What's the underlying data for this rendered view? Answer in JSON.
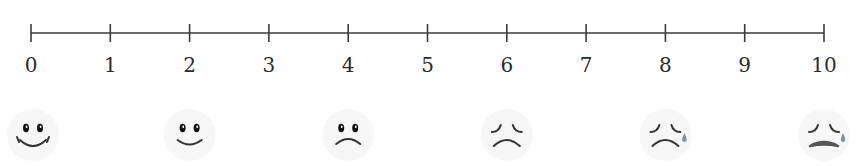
{
  "scale": {
    "min": 0,
    "max": 10,
    "step": 1,
    "labels": [
      "0",
      "1",
      "2",
      "3",
      "4",
      "5",
      "6",
      "7",
      "8",
      "9",
      "10"
    ]
  },
  "faces": [
    {
      "value": 0,
      "expression": "big-smile",
      "icon": "big-smile-face-icon",
      "tear": false
    },
    {
      "value": 2,
      "expression": "smile",
      "icon": "smile-face-icon",
      "tear": false
    },
    {
      "value": 4,
      "expression": "slight-frown",
      "icon": "frown-face-icon",
      "tear": false
    },
    {
      "value": 6,
      "expression": "frown-closed-eyes",
      "icon": "frown-closed-eyes-face-icon",
      "tear": false
    },
    {
      "value": 8,
      "expression": "frown-tear",
      "icon": "crying-face-icon",
      "tear": true
    },
    {
      "value": 10,
      "expression": "crying",
      "icon": "worst-pain-face-icon",
      "tear": true
    }
  ],
  "colors": {
    "line": "#3a3a3a",
    "text": "#2b2b2b",
    "face_stroke": "#333333",
    "face_fill": "#f7f7f7",
    "tear": "#8a9099"
  }
}
